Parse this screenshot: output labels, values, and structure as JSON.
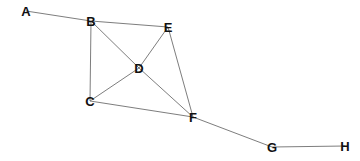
{
  "diagram": {
    "type": "undirected-graph",
    "nodes": [
      {
        "id": "A",
        "label": "A",
        "x": 26,
        "y": 11
      },
      {
        "id": "B",
        "label": "B",
        "x": 91,
        "y": 21
      },
      {
        "id": "E",
        "label": "E",
        "x": 168,
        "y": 27
      },
      {
        "id": "D",
        "label": "D",
        "x": 139,
        "y": 68
      },
      {
        "id": "C",
        "label": "C",
        "x": 90,
        "y": 101
      },
      {
        "id": "F",
        "label": "F",
        "x": 193,
        "y": 117
      },
      {
        "id": "G",
        "label": "G",
        "x": 272,
        "y": 147
      },
      {
        "id": "H",
        "label": "H",
        "x": 345,
        "y": 146
      }
    ],
    "edges": [
      [
        "A",
        "B"
      ],
      [
        "B",
        "E"
      ],
      [
        "B",
        "D"
      ],
      [
        "B",
        "C"
      ],
      [
        "E",
        "D"
      ],
      [
        "E",
        "F"
      ],
      [
        "D",
        "C"
      ],
      [
        "D",
        "F"
      ],
      [
        "C",
        "F"
      ],
      [
        "F",
        "G"
      ],
      [
        "G",
        "H"
      ]
    ],
    "colors": {
      "edge": "#6e6e6e",
      "label": "#111111",
      "background": "#ffffff"
    }
  }
}
